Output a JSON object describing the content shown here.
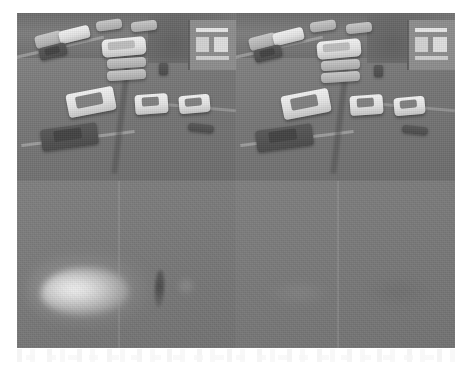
{
  "figure": {
    "caption": "",
    "background_color": "#ffffff",
    "panel_border_color": "#5f5f5f",
    "layout": {
      "rows": 2,
      "columns": 2,
      "total_panels": 4
    },
    "panels": [
      {
        "id": "panel-top-left",
        "position": "top-left",
        "type": "grayscale-photograph",
        "content": "Aerial view of a road intersection with parked and moving cars",
        "base_gray": "#7b7b7b",
        "elements": [
          "white van",
          "two white sedans",
          "light gray car",
          "dark car",
          "building with windows",
          "kerb lines",
          "tree line"
        ]
      },
      {
        "id": "panel-top-right",
        "position": "top-right",
        "type": "grayscale-photograph",
        "content": "Aerial view of the same road intersection, second frame",
        "base_gray": "#7b7b7b",
        "elements": [
          "white van",
          "two white sedans",
          "light gray car",
          "dark car",
          "building with windows",
          "kerb lines",
          "tree line"
        ]
      },
      {
        "id": "panel-bottom-left",
        "position": "bottom-left",
        "type": "grayscale-response-map",
        "content": "Flat gray map with one bright elliptical blob at left and a dark vertical streak at right",
        "base_gray": "#7a7a7a",
        "elements": [
          "bright blob",
          "dark vertical streak"
        ]
      },
      {
        "id": "panel-bottom-right",
        "position": "bottom-right",
        "type": "grayscale-response-map",
        "content": "Nearly uniform flat gray map with no strong response",
        "base_gray": "#787878",
        "elements": []
      }
    ]
  },
  "artifacts": {
    "scan_residue_label": "faint scanner residue strip below figure"
  }
}
